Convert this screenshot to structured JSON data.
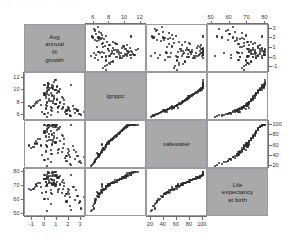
{
  "figure": {
    "top_strip_text": "··· ···      ···        ·        ·            ·",
    "background_color": "#ffffff",
    "panel_border_color": "#9a9aa0",
    "diagonal_fill_color": "#a9a9a9",
    "point_color": "#2e2e2e"
  },
  "chart_data": {
    "type": "scatter",
    "title": "",
    "subtitle": "",
    "matrix": true,
    "grid": false,
    "legend": "none",
    "variables": [
      {
        "key": "growth",
        "label": "Avg\nannual\n%\ngrowth",
        "axis_label": "Avg annual % growth",
        "range": [
          -1.6,
          3.4
        ],
        "ticks": [
          -1,
          0,
          1,
          2,
          3
        ],
        "bottom_ticks": [
          -1,
          0,
          1,
          2,
          3
        ],
        "right_ticks": [
          3,
          2,
          1,
          0,
          -1
        ]
      },
      {
        "key": "lgnppc",
        "label": "lgnppc",
        "axis_label": "lgnppc",
        "range": [
          5.0,
          12.8
        ],
        "ticks": [
          6,
          8,
          10,
          12
        ],
        "top_ticks": [
          6,
          8,
          10,
          12
        ],
        "left_ticks": [
          12,
          10,
          8,
          6
        ]
      },
      {
        "key": "safewater",
        "label": "safewater",
        "axis_label": "safewater",
        "range": [
          14,
          108
        ],
        "ticks": [
          20,
          40,
          60,
          80,
          100
        ],
        "bottom_ticks": [
          20,
          40,
          60,
          80,
          100
        ],
        "right_ticks": [
          100,
          80,
          60,
          40,
          20
        ]
      },
      {
        "key": "lifeexp",
        "label": "Life\nexpectancy\nat birth",
        "axis_label": "Life expectancy at birth",
        "range": [
          48,
          82
        ],
        "ticks": [
          50,
          60,
          70,
          80
        ],
        "top_ticks": [
          50,
          60,
          70,
          80
        ],
        "left_ticks": [
          80,
          70,
          60,
          50
        ]
      }
    ],
    "observations": [
      {
        "growth": 0.6,
        "lgnppc": 7.1,
        "safewater": 62,
        "lifeexp": 71
      },
      {
        "growth": 0.2,
        "lgnppc": 7.5,
        "safewater": 58,
        "lifeexp": 70
      },
      {
        "growth": 1.1,
        "lgnppc": 6.4,
        "safewater": 45,
        "lifeexp": 66
      },
      {
        "growth": 2.4,
        "lgnppc": 7.0,
        "safewater": 52,
        "lifeexp": 69
      },
      {
        "growth": 0.4,
        "lgnppc": 8.2,
        "safewater": 70,
        "lifeexp": 72
      },
      {
        "growth": 0.1,
        "lgnppc": 9.0,
        "safewater": 78,
        "lifeexp": 73
      },
      {
        "growth": 1.8,
        "lgnppc": 6.7,
        "safewater": 40,
        "lifeexp": 64
      },
      {
        "growth": 0.9,
        "lgnppc": 7.8,
        "safewater": 66,
        "lifeexp": 71
      },
      {
        "growth": -0.3,
        "lgnppc": 7.6,
        "safewater": 60,
        "lifeexp": 69
      },
      {
        "growth": 0.3,
        "lgnppc": 10.1,
        "safewater": 94,
        "lifeexp": 76
      },
      {
        "growth": 0.5,
        "lgnppc": 10.4,
        "safewater": 98,
        "lifeexp": 77
      },
      {
        "growth": 0.7,
        "lgnppc": 10.2,
        "safewater": 96,
        "lifeexp": 77
      },
      {
        "growth": 1.0,
        "lgnppc": 10.6,
        "safewater": 100,
        "lifeexp": 78
      },
      {
        "growth": 0.2,
        "lgnppc": 10.3,
        "safewater": 99,
        "lifeexp": 78
      },
      {
        "growth": 2.9,
        "lgnppc": 6.2,
        "safewater": 30,
        "lifeexp": 59
      },
      {
        "growth": 2.1,
        "lgnppc": 6.6,
        "safewater": 38,
        "lifeexp": 62
      },
      {
        "growth": 1.5,
        "lgnppc": 7.2,
        "safewater": 55,
        "lifeexp": 68
      },
      {
        "growth": 0.8,
        "lgnppc": 8.6,
        "safewater": 74,
        "lifeexp": 72
      },
      {
        "growth": -0.6,
        "lgnppc": 7.9,
        "safewater": 64,
        "lifeexp": 70
      },
      {
        "growth": -0.9,
        "lgnppc": 7.4,
        "safewater": 57,
        "lifeexp": 68
      },
      {
        "growth": 0.0,
        "lgnppc": 9.6,
        "safewater": 88,
        "lifeexp": 75
      },
      {
        "growth": 0.4,
        "lgnppc": 9.2,
        "safewater": 82,
        "lifeexp": 74
      },
      {
        "growth": 1.3,
        "lgnppc": 8.0,
        "safewater": 68,
        "lifeexp": 71
      },
      {
        "growth": 2.6,
        "lgnppc": 6.9,
        "safewater": 48,
        "lifeexp": 67
      },
      {
        "growth": 1.9,
        "lgnppc": 7.3,
        "safewater": 54,
        "lifeexp": 68
      },
      {
        "growth": 0.6,
        "lgnppc": 10.5,
        "safewater": 100,
        "lifeexp": 79
      },
      {
        "growth": 0.9,
        "lgnppc": 10.0,
        "safewater": 97,
        "lifeexp": 77
      },
      {
        "growth": 1.2,
        "lgnppc": 9.8,
        "safewater": 92,
        "lifeexp": 76
      },
      {
        "growth": 0.1,
        "lgnppc": 8.8,
        "safewater": 76,
        "lifeexp": 73
      },
      {
        "growth": -0.4,
        "lgnppc": 8.4,
        "safewater": 72,
        "lifeexp": 72
      },
      {
        "growth": 3.0,
        "lgnppc": 6.0,
        "safewater": 26,
        "lifeexp": 54
      },
      {
        "growth": 2.2,
        "lgnppc": 5.8,
        "safewater": 22,
        "lifeexp": 53
      },
      {
        "growth": 0.3,
        "lgnppc": 6.3,
        "safewater": 34,
        "lifeexp": 61
      },
      {
        "growth": 0.5,
        "lgnppc": 6.8,
        "safewater": 44,
        "lifeexp": 65
      },
      {
        "growth": 1.6,
        "lgnppc": 7.7,
        "safewater": 63,
        "lifeexp": 70
      },
      {
        "growth": 0.2,
        "lgnppc": 9.4,
        "safewater": 86,
        "lifeexp": 75
      },
      {
        "growth": 0.7,
        "lgnppc": 10.7,
        "safewater": 100,
        "lifeexp": 79
      },
      {
        "growth": 0.0,
        "lgnppc": 10.8,
        "safewater": 100,
        "lifeexp": 78
      },
      {
        "growth": 0.4,
        "lgnppc": 11.0,
        "safewater": 100,
        "lifeexp": 79
      },
      {
        "growth": 0.6,
        "lgnppc": 10.9,
        "safewater": 100,
        "lifeexp": 80
      },
      {
        "growth": 1.4,
        "lgnppc": 8.9,
        "safewater": 80,
        "lifeexp": 73
      },
      {
        "growth": 2.0,
        "lgnppc": 7.1,
        "safewater": 50,
        "lifeexp": 67
      },
      {
        "growth": -0.2,
        "lgnppc": 6.5,
        "safewater": 42,
        "lifeexp": 65
      },
      {
        "growth": 0.8,
        "lgnppc": 9.1,
        "safewater": 84,
        "lifeexp": 74
      },
      {
        "growth": 1.1,
        "lgnppc": 9.9,
        "safewater": 95,
        "lifeexp": 76
      },
      {
        "growth": 0.5,
        "lgnppc": 8.3,
        "safewater": 71,
        "lifeexp": 72
      },
      {
        "growth": 0.1,
        "lgnppc": 7.0,
        "safewater": 47,
        "lifeexp": 66
      },
      {
        "growth": 2.8,
        "lgnppc": 6.1,
        "safewater": 28,
        "lifeexp": 58
      },
      {
        "growth": 1.7,
        "lgnppc": 6.4,
        "safewater": 36,
        "lifeexp": 63
      },
      {
        "growth": 0.3,
        "lgnppc": 11.2,
        "safewater": 100,
        "lifeexp": 80
      },
      {
        "growth": 0.9,
        "lgnppc": 10.1,
        "safewater": 99,
        "lifeexp": 78
      },
      {
        "growth": -0.7,
        "lgnppc": 8.1,
        "safewater": 69,
        "lifeexp": 71
      },
      {
        "growth": -1.1,
        "lgnppc": 7.2,
        "safewater": 56,
        "lifeexp": 67
      },
      {
        "growth": 0.2,
        "lgnppc": 9.7,
        "safewater": 90,
        "lifeexp": 76
      },
      {
        "growth": 1.0,
        "lgnppc": 8.5,
        "safewater": 75,
        "lifeexp": 73
      },
      {
        "growth": 2.3,
        "lgnppc": 7.5,
        "safewater": 59,
        "lifeexp": 69
      },
      {
        "growth": 0.6,
        "lgnppc": 6.6,
        "safewater": 43,
        "lifeexp": 64
      },
      {
        "growth": 0.4,
        "lgnppc": 10.3,
        "safewater": 100,
        "lifeexp": 79
      },
      {
        "growth": 0.0,
        "lgnppc": 9.3,
        "safewater": 85,
        "lifeexp": 75
      },
      {
        "growth": 1.5,
        "lgnppc": 8.7,
        "safewater": 79,
        "lifeexp": 74
      },
      {
        "growth": 0.7,
        "lgnppc": 7.9,
        "safewater": 67,
        "lifeexp": 71
      },
      {
        "growth": 2.5,
        "lgnppc": 6.3,
        "safewater": 33,
        "lifeexp": 60
      },
      {
        "growth": 0.2,
        "lgnppc": 5.6,
        "safewater": 20,
        "lifeexp": 52
      },
      {
        "growth": 1.2,
        "lgnppc": 7.4,
        "safewater": 53,
        "lifeexp": 68
      },
      {
        "growth": 0.5,
        "lgnppc": 9.5,
        "safewater": 89,
        "lifeexp": 75
      },
      {
        "growth": 0.8,
        "lgnppc": 11.4,
        "safewater": 100,
        "lifeexp": 80
      },
      {
        "growth": 0.3,
        "lgnppc": 10.6,
        "safewater": 100,
        "lifeexp": 79
      },
      {
        "growth": -0.5,
        "lgnppc": 8.2,
        "safewater": 73,
        "lifeexp": 72
      },
      {
        "growth": 1.9,
        "lgnppc": 6.9,
        "safewater": 46,
        "lifeexp": 66
      },
      {
        "growth": 0.1,
        "lgnppc": 7.6,
        "safewater": 61,
        "lifeexp": 70
      },
      {
        "growth": 2.7,
        "lgnppc": 6.7,
        "safewater": 39,
        "lifeexp": 63
      },
      {
        "growth": 0.6,
        "lgnppc": 9.0,
        "safewater": 81,
        "lifeexp": 74
      },
      {
        "growth": 1.3,
        "lgnppc": 10.2,
        "safewater": 97,
        "lifeexp": 77
      },
      {
        "growth": 0.4,
        "lgnppc": 8.6,
        "safewater": 77,
        "lifeexp": 73
      },
      {
        "growth": 0.9,
        "lgnppc": 7.8,
        "safewater": 65,
        "lifeexp": 70
      },
      {
        "growth": 0.0,
        "lgnppc": 6.2,
        "safewater": 31,
        "lifeexp": 61
      },
      {
        "growth": 2.1,
        "lgnppc": 5.9,
        "safewater": 24,
        "lifeexp": 56
      },
      {
        "growth": 0.7,
        "lgnppc": 10.4,
        "safewater": 100,
        "lifeexp": 78
      },
      {
        "growth": 0.2,
        "lgnppc": 9.9,
        "safewater": 93,
        "lifeexp": 76
      },
      {
        "growth": 1.6,
        "lgnppc": 8.4,
        "safewater": 72,
        "lifeexp": 72
      },
      {
        "growth": 0.5,
        "lgnppc": 7.3,
        "safewater": 51,
        "lifeexp": 67
      },
      {
        "growth": -0.8,
        "lgnppc": 7.7,
        "safewater": 64,
        "lifeexp": 69
      },
      {
        "growth": 3.2,
        "lgnppc": 6.5,
        "safewater": 37,
        "lifeexp": 62
      },
      {
        "growth": 0.3,
        "lgnppc": 11.1,
        "safewater": 100,
        "lifeexp": 80
      },
      {
        "growth": 1.0,
        "lgnppc": 9.6,
        "safewater": 91,
        "lifeexp": 76
      },
      {
        "growth": 0.8,
        "lgnppc": 8.8,
        "safewater": 78,
        "lifeexp": 73
      },
      {
        "growth": 0.1,
        "lgnppc": 7.1,
        "safewater": 49,
        "lifeexp": 66
      },
      {
        "growth": 2.0,
        "lgnppc": 6.8,
        "safewater": 41,
        "lifeexp": 64
      },
      {
        "growth": 0.4,
        "lgnppc": 10.0,
        "safewater": 96,
        "lifeexp": 77
      },
      {
        "growth": 0.6,
        "lgnppc": 9.2,
        "safewater": 83,
        "lifeexp": 74
      },
      {
        "growth": 1.4,
        "lgnppc": 7.0,
        "safewater": 48,
        "lifeexp": 65
      },
      {
        "growth": -1.3,
        "lgnppc": 7.5,
        "safewater": 60,
        "lifeexp": 68
      },
      {
        "growth": 0.2,
        "lgnppc": 8.0,
        "safewater": 68,
        "lifeexp": 71
      },
      {
        "growth": 2.2,
        "lgnppc": 10.8,
        "safewater": 100,
        "lifeexp": 78
      },
      {
        "growth": 0.9,
        "lgnppc": 11.6,
        "safewater": 100,
        "lifeexp": 80
      },
      {
        "growth": 0.5,
        "lgnppc": 6.0,
        "safewater": 27,
        "lifeexp": 57
      },
      {
        "growth": 1.8,
        "lgnppc": 6.1,
        "safewater": 29,
        "lifeexp": 59
      },
      {
        "growth": 0.0,
        "lgnppc": 9.4,
        "safewater": 87,
        "lifeexp": 75
      },
      {
        "growth": 0.7,
        "lgnppc": 8.3,
        "safewater": 70,
        "lifeexp": 72
      },
      {
        "growth": 1.1,
        "lgnppc": 7.2,
        "safewater": 52,
        "lifeexp": 67
      },
      {
        "growth": 0.3,
        "lgnppc": 10.7,
        "safewater": 100,
        "lifeexp": 79
      }
    ]
  }
}
